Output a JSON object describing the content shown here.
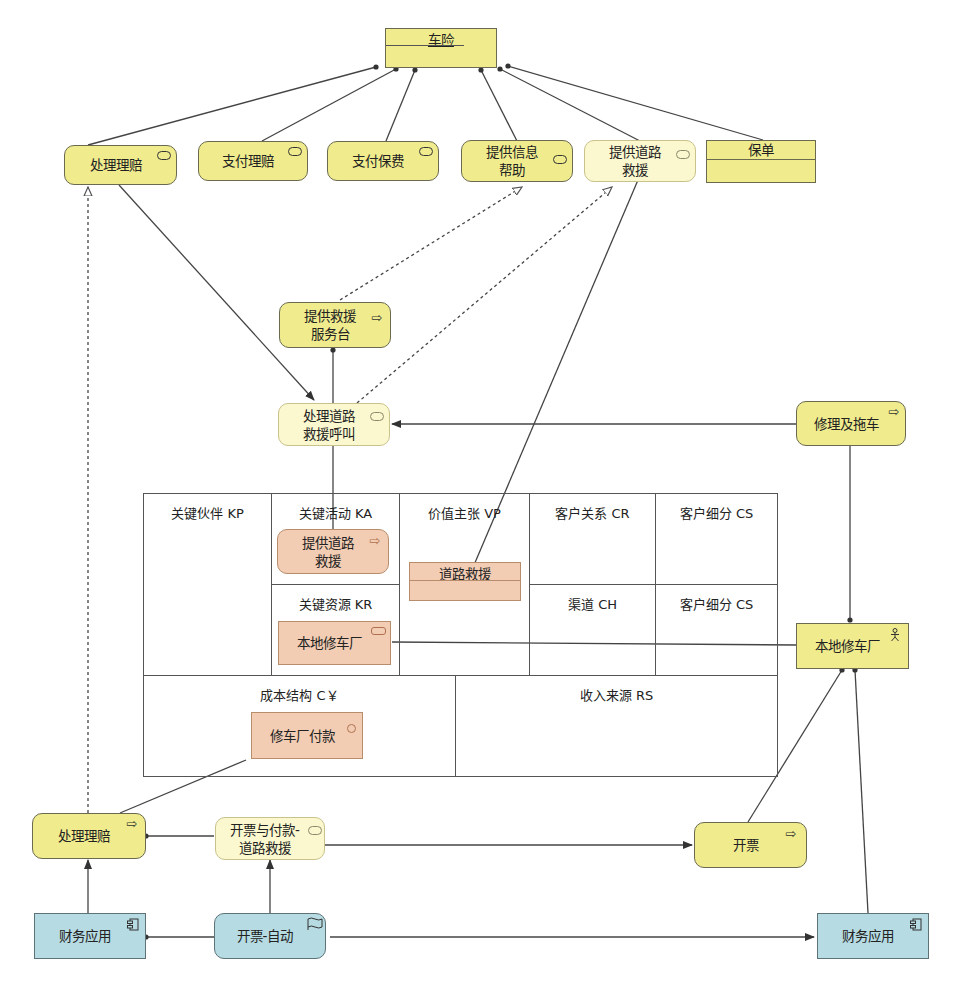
{
  "diagram": {
    "colors": {
      "business_yellow": "#f0ec8e",
      "business_light": "#fbf8cf",
      "bmc_orange": "#f2cdb4",
      "application_blue": "#b6dbe2",
      "line": "#444444"
    },
    "product": {
      "title": "车险",
      "icon": "product-icon"
    },
    "top_services": [
      {
        "label": "处理理赔",
        "icon": "service-icon"
      },
      {
        "label": "支付理赔",
        "icon": "service-icon"
      },
      {
        "label": "支付保费",
        "icon": "service-icon"
      },
      {
        "label": "提供信息\n帮助",
        "icon": "service-icon"
      },
      {
        "label": "提供道路\n救援",
        "icon": "service-icon"
      }
    ],
    "contract": {
      "title": "保单",
      "icon": "contract-icon"
    },
    "process_helpdesk": {
      "label": "提供救援\n服务台",
      "icon": "process-arrow-icon"
    },
    "service_handle_call": {
      "label": "处理道路\n救援呼叫",
      "icon": "service-icon"
    },
    "process_repair_tow": {
      "label": "修理及拖车",
      "icon": "process-arrow-icon"
    },
    "business_model_canvas": {
      "cells": {
        "kp": "关键伙伴 KP",
        "ka": "关键活动 KA",
        "vp": "价值主张 VP",
        "cr": "客户关系 CR",
        "cs_top": "客户细分 CS",
        "kr": "关键资源 KR",
        "ch": "渠道 CH",
        "cs_bottom": "客户细分 CS",
        "cost": "成本结构 C￥",
        "revenue": "收入来源 RS"
      },
      "elements": {
        "ka_process": {
          "label": "提供道路\n救援",
          "icon": "process-arrow-icon"
        },
        "vp_value": {
          "label": "道路救援"
        },
        "kr_resource": {
          "label": "本地修车厂",
          "icon": "resource-icon"
        },
        "cost_item": {
          "label": "修车厂付款",
          "icon": "circle-icon"
        }
      }
    },
    "role_garage": {
      "label": "本地修车厂",
      "icon": "actor-icon"
    },
    "process_claims_bottom": {
      "label": "处理理赔",
      "icon": "process-arrow-icon"
    },
    "service_invoice_pay": {
      "label": "开票与付款-\n道路救援",
      "icon": "service-icon"
    },
    "process_invoice": {
      "label": "开票",
      "icon": "process-arrow-icon"
    },
    "app_finance_left": {
      "label": "财务应用",
      "icon": "component-icon"
    },
    "app_invoice_auto": {
      "label": "开票-自动",
      "icon": "event-flag-icon"
    },
    "app_finance_right": {
      "label": "财务应用",
      "icon": "component-icon"
    }
  }
}
